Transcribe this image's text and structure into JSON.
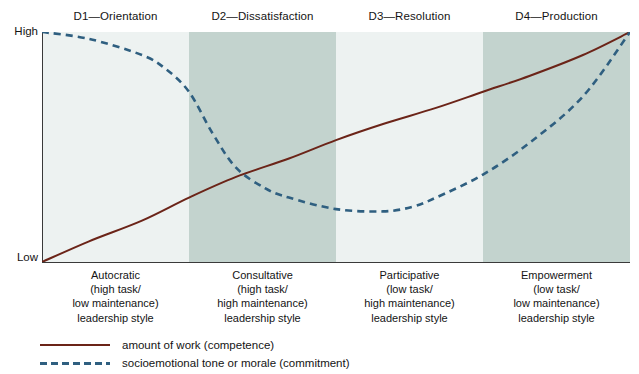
{
  "chart_data": {
    "type": "line",
    "title": "",
    "xlabel": "",
    "ylabel": "",
    "ylim": [
      0,
      100
    ],
    "ytick_labels": [
      "High",
      "Low"
    ],
    "grid": false,
    "legend_position": "bottom-left",
    "categories": [
      "D1—Orientation",
      "D2—Dissatisfaction",
      "D3—Resolution",
      "D4—Production"
    ],
    "band_shades": [
      "light",
      "dark",
      "light",
      "dark"
    ],
    "band_boundaries_px": [
      42,
      192,
      337,
      487,
      630
    ],
    "series": [
      {
        "name": "amount of work (competence)",
        "style": "solid",
        "color": "#6b2418",
        "x": [
          0,
          8,
          17,
          25,
          33,
          42,
          50,
          58,
          67,
          75,
          83,
          92,
          100
        ],
        "values": [
          0,
          9,
          18,
          28,
          37,
          45,
          53,
          60,
          67,
          74,
          81,
          90,
          100
        ]
      },
      {
        "name": "socioemotional tone or morale (commitment)",
        "style": "dashed",
        "color": "#2f5f80",
        "x": [
          0,
          8,
          17,
          21,
          25,
          29,
          33,
          38,
          42,
          50,
          58,
          63,
          67,
          75,
          83,
          92,
          100
        ],
        "values": [
          100,
          97,
          90,
          84,
          74,
          56,
          41,
          32,
          28,
          23,
          22,
          24,
          28,
          38,
          52,
          72,
          100
        ]
      }
    ]
  },
  "phase_headers": [
    "D1—Orientation",
    "D2—Dissatisfaction",
    "D3—Resolution",
    "D4—Production"
  ],
  "axis": {
    "high_label": "High",
    "low_label": "Low"
  },
  "style_labels": [
    {
      "line1": "Autocratic",
      "line2": "(high task/",
      "line3": "low maintenance)",
      "line4": "leadership style"
    },
    {
      "line1": "Consultative",
      "line2": "(high task/",
      "line3": "high maintenance)",
      "line4": "leadership style"
    },
    {
      "line1": "Participative",
      "line2": "(low task/",
      "line3": "high maintenance)",
      "line4": "leadership style"
    },
    {
      "line1": "Empowerment",
      "line2": "(low task/",
      "line3": "low maintenance)",
      "line4": "leadership style"
    }
  ],
  "legend": [
    {
      "label": "amount of work (competence)",
      "style": "solid",
      "color": "#6b2418"
    },
    {
      "label": "socioemotional tone or morale (commitment)",
      "style": "dashed",
      "color": "#2f5f80"
    }
  ],
  "colors": {
    "band_light": "#edf2f1",
    "band_dark": "#c3d3ce",
    "solid_line": "#6b2418",
    "dashed_line": "#2f5f80",
    "axis": "#3a3a3a",
    "text": "#141414",
    "background": "#ffffff"
  }
}
